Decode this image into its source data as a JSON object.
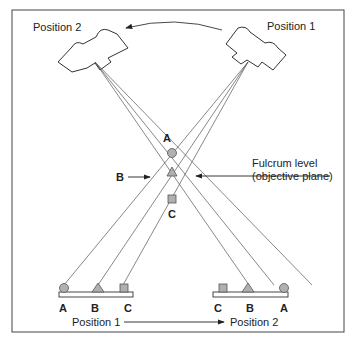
{
  "diagram": {
    "type": "tomography-principle",
    "tube_labels": {
      "left": "Position 2",
      "right": "Position 1"
    },
    "object_points": {
      "A": "A",
      "B": "B",
      "C": "C"
    },
    "fulcrum_label_line1": "Fulcrum level",
    "fulcrum_label_line2": "(objective plane)",
    "b_arrow_label": "B",
    "detector_left_labels": [
      "A",
      "B",
      "C"
    ],
    "detector_right_labels": [
      "C",
      "B",
      "A"
    ],
    "bottom_caption_left": "Position 1",
    "bottom_caption_right": "Position 2",
    "colors": {
      "line": "#555555",
      "shape_fill": "#b0b0b0",
      "frame": "#444444"
    }
  }
}
